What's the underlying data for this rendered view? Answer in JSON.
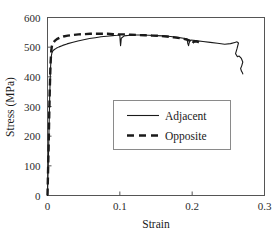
{
  "chart_data": {
    "type": "line",
    "title": "",
    "xlabel": "Strain",
    "ylabel": "Stress (MPa)",
    "xlim": [
      0,
      0.3
    ],
    "ylim": [
      0,
      600
    ],
    "xticks": [
      0,
      0.1,
      0.2,
      0.3
    ],
    "xtick_labels": [
      "0",
      "0.1",
      "0.2",
      "0.3"
    ],
    "yticks": [
      0,
      100,
      200,
      300,
      400,
      500,
      600
    ],
    "ytick_labels": [
      "0",
      "100",
      "200",
      "300",
      "400",
      "500",
      "600"
    ],
    "grid": false,
    "legend_position": "center",
    "series": [
      {
        "name": "Adjacent",
        "style": "solid",
        "color": "#1a1a1a",
        "x": [
          0.0,
          0.0015,
          0.003,
          0.0042,
          0.005,
          0.006,
          0.0075,
          0.0095,
          0.012,
          0.016,
          0.021,
          0.027,
          0.034,
          0.042,
          0.05,
          0.058,
          0.066,
          0.074,
          0.082,
          0.09,
          0.096,
          0.0995,
          0.1,
          0.1005,
          0.101,
          0.1015,
          0.102,
          0.106,
          0.114,
          0.122,
          0.13,
          0.14,
          0.15,
          0.16,
          0.17,
          0.18,
          0.188,
          0.193,
          0.194,
          0.195,
          0.196,
          0.198,
          0.205,
          0.215,
          0.225,
          0.235,
          0.245,
          0.253,
          0.259,
          0.262,
          0.264,
          0.262,
          0.26,
          0.2625,
          0.265,
          0.268,
          0.27,
          0.2685,
          0.267,
          0.268,
          0.2695,
          0.27
        ],
        "y": [
          0,
          150,
          330,
          430,
          465,
          480,
          488,
          492,
          496,
          501,
          506,
          511,
          516,
          521,
          525,
          529,
          532,
          535,
          537,
          539,
          540,
          541,
          541,
          520,
          505,
          516,
          530,
          538,
          540,
          541,
          541,
          540,
          539,
          538,
          536,
          533,
          530,
          528,
          512,
          505,
          516,
          524,
          522,
          519,
          516,
          513,
          510,
          512,
          516,
          518,
          514,
          495,
          478,
          468,
          470,
          462,
          450,
          437,
          428,
          420,
          414,
          410
        ]
      },
      {
        "name": "Opposite",
        "style": "dashed",
        "color": "#1a1a1a",
        "x": [
          0.0,
          0.0015,
          0.003,
          0.0042,
          0.0052,
          0.0062,
          0.0078,
          0.01,
          0.013,
          0.017,
          0.022,
          0.028,
          0.035,
          0.043,
          0.051,
          0.059,
          0.067,
          0.075,
          0.083,
          0.091,
          0.099,
          0.107,
          0.115,
          0.125,
          0.135,
          0.145,
          0.155,
          0.165,
          0.175,
          0.184,
          0.19,
          0.195,
          0.198,
          0.2,
          0.202,
          0.205,
          0.208,
          0.21
        ],
        "y": [
          0,
          160,
          345,
          445,
          488,
          505,
          514,
          521,
          527,
          532,
          536,
          539,
          541,
          543,
          544,
          545,
          545,
          545,
          545,
          544,
          543,
          543,
          542,
          541,
          540,
          539,
          538,
          536,
          533,
          530,
          527,
          524,
          518,
          512,
          518,
          520,
          518,
          515
        ]
      }
    ]
  },
  "legend": {
    "entries": [
      {
        "label": "Adjacent",
        "style": "solid"
      },
      {
        "label": "Opposite",
        "style": "dashed"
      }
    ]
  }
}
